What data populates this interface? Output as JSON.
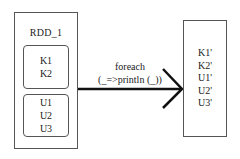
{
  "diagram": {
    "source_rdd": {
      "title": "RDD_1",
      "partitions": [
        {
          "items": [
            "K1",
            "K2"
          ]
        },
        {
          "items": [
            "U1",
            "U2",
            "U3"
          ]
        }
      ]
    },
    "operation": {
      "line1": "foreach",
      "line2": "(_=>println (_))"
    },
    "output": {
      "items": [
        "K1'",
        "K2'",
        "U1'",
        "U2'",
        "U3'"
      ]
    }
  }
}
